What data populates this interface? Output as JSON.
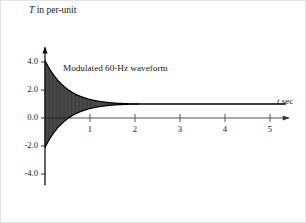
{
  "chart_data": {
    "type": "line",
    "title": "",
    "subtitle": "",
    "xlabel": "t sec",
    "ylabel": "T in per-unit",
    "ylabel_symbol": "T",
    "ylabel_rest": " in per-unit",
    "xlabel_symbol": "t",
    "xlabel_rest": " sec",
    "xlim": [
      0,
      5.35
    ],
    "ylim": [
      -4.8,
      4.9
    ],
    "xticks": [
      1,
      2,
      3,
      4,
      5
    ],
    "xtick_labels": [
      "1",
      "2",
      "3",
      "4",
      "5"
    ],
    "yticks": [
      4.0,
      2.0,
      0.0,
      -2.0,
      -4.0
    ],
    "ytick_labels": [
      "4.0",
      "2.0",
      "0.0",
      "-2.0",
      "-4.0"
    ],
    "grid": false,
    "legend": false,
    "annotations": [
      {
        "text": "Modulated 60-Hz waveform",
        "x": 0.45,
        "y": 3.15,
        "name": "waveform-annotation"
      }
    ],
    "series": [
      {
        "name": "Modulated 60-Hz waveform",
        "color": "#101010",
        "description": "Exponentially decaying 60-Hz oscillation about a steady offset",
        "steady_state_value": 1.0,
        "offset": 1.0,
        "initial_envelope_amplitude": 3.1,
        "envelope_decay_time_constant": 0.62,
        "oscillation_frequency_hz": 60,
        "initial_peak": 4.1,
        "initial_trough": -2.2,
        "settling_time": 2.1,
        "envelope_upper_points": [
          [
            0.0,
            4.1
          ],
          [
            0.1,
            3.72
          ],
          [
            0.2,
            3.38
          ],
          [
            0.3,
            3.1
          ],
          [
            0.4,
            2.84
          ],
          [
            0.5,
            2.6
          ],
          [
            0.6,
            2.4
          ],
          [
            0.7,
            2.22
          ],
          [
            0.8,
            2.06
          ],
          [
            0.9,
            1.92
          ],
          [
            1.0,
            1.8
          ],
          [
            1.1,
            1.7
          ],
          [
            1.2,
            1.61
          ],
          [
            1.3,
            1.53
          ],
          [
            1.4,
            1.46
          ],
          [
            1.5,
            1.4
          ],
          [
            1.6,
            1.33
          ],
          [
            1.7,
            1.27
          ],
          [
            1.8,
            1.2
          ],
          [
            1.9,
            1.14
          ],
          [
            2.0,
            1.07
          ],
          [
            2.1,
            1.0
          ],
          [
            5.35,
            1.0
          ]
        ],
        "envelope_lower_points": [
          [
            0.0,
            -2.2
          ],
          [
            0.1,
            -1.82
          ],
          [
            0.2,
            -1.48
          ],
          [
            0.3,
            -1.2
          ],
          [
            0.4,
            -0.94
          ],
          [
            0.5,
            -0.7
          ],
          [
            0.6,
            -0.5
          ],
          [
            0.7,
            -0.32
          ],
          [
            0.8,
            -0.16
          ],
          [
            0.9,
            -0.02
          ],
          [
            1.0,
            0.1
          ],
          [
            1.1,
            0.2
          ],
          [
            1.2,
            0.29
          ],
          [
            1.3,
            0.37
          ],
          [
            1.4,
            0.44
          ],
          [
            1.5,
            0.5
          ],
          [
            1.6,
            0.57
          ],
          [
            1.7,
            0.63
          ],
          [
            1.8,
            0.7
          ],
          [
            1.9,
            0.76
          ],
          [
            2.0,
            0.83
          ],
          [
            2.1,
            1.0
          ],
          [
            5.35,
            1.0
          ]
        ]
      }
    ]
  }
}
